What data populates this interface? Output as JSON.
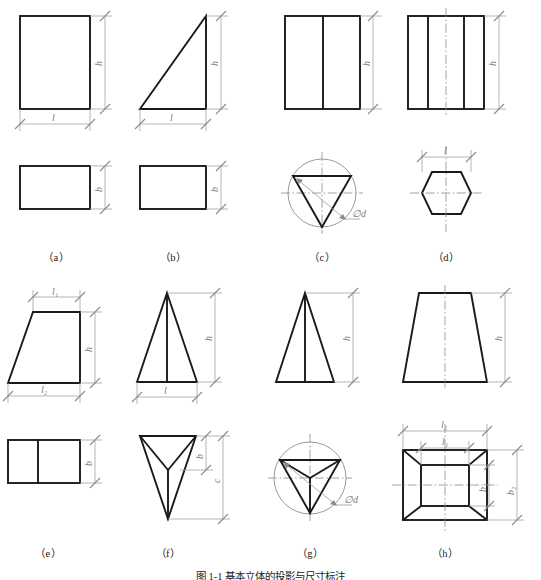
{
  "figure": {
    "caption_label": "图 1-1",
    "caption_text": "基本立体的投影与尺寸标注",
    "caption_full": "图 1-1    基本立体的投影与尺寸标注"
  },
  "style": {
    "object_line_color": "#1a1a1a",
    "dimension_line_color": "#9a9a9a",
    "center_line_color": "#8c8c8c",
    "background": "#ffffff",
    "label_color": "#222222"
  },
  "panels": [
    {
      "id": "a",
      "label": "（a）",
      "solid": "rectangular-prism",
      "front_view": "rectangle",
      "top_view": "rectangle",
      "dimensions": [
        {
          "name": "h",
          "label": "h",
          "view": "front",
          "orientation": "vertical"
        },
        {
          "name": "l",
          "label": "l",
          "view": "front",
          "orientation": "horizontal"
        },
        {
          "name": "b",
          "label": "b",
          "view": "top",
          "orientation": "vertical"
        }
      ]
    },
    {
      "id": "b",
      "label": "（b）",
      "solid": "triangular-wedge",
      "front_view": "right-triangle",
      "top_view": "rectangle",
      "dimensions": [
        {
          "name": "h",
          "label": "h",
          "view": "front",
          "orientation": "vertical"
        },
        {
          "name": "l",
          "label": "l",
          "view": "front",
          "orientation": "horizontal"
        },
        {
          "name": "b",
          "label": "b",
          "view": "top",
          "orientation": "vertical"
        }
      ]
    },
    {
      "id": "c",
      "label": "（c）",
      "solid": "triangular-prism",
      "front_view": "rectangle-with-vertical-edge",
      "top_view": "inverted-triangle-in-circle",
      "dimensions": [
        {
          "name": "h",
          "label": "h",
          "view": "front",
          "orientation": "vertical"
        },
        {
          "name": "d",
          "label": "∅d",
          "view": "top",
          "orientation": "leader"
        }
      ]
    },
    {
      "id": "d",
      "label": "（d）",
      "solid": "hexagonal-prism",
      "front_view": "rectangle-with-two-vertical-edges",
      "top_view": "hexagon",
      "dimensions": [
        {
          "name": "h",
          "label": "h",
          "view": "front",
          "orientation": "vertical"
        },
        {
          "name": "l",
          "label": "l",
          "view": "top",
          "orientation": "horizontal"
        }
      ]
    },
    {
      "id": "e",
      "label": "（e）",
      "solid": "trapezoidal-prism",
      "front_view": "trapezoid",
      "top_view": "rectangle-divided",
      "dimensions": [
        {
          "name": "l1",
          "label": "l₁",
          "view": "front",
          "orientation": "horizontal"
        },
        {
          "name": "h",
          "label": "h",
          "view": "front",
          "orientation": "vertical"
        },
        {
          "name": "l2",
          "label": "l₂",
          "view": "front",
          "orientation": "horizontal"
        },
        {
          "name": "b",
          "label": "b",
          "view": "top",
          "orientation": "vertical"
        }
      ]
    },
    {
      "id": "f",
      "label": "（f）",
      "solid": "triangular-pyramid",
      "front_view": "triangle-with-center-edge",
      "top_view": "inverted-pyramid-projection",
      "dimensions": [
        {
          "name": "h",
          "label": "h",
          "view": "front",
          "orientation": "vertical"
        },
        {
          "name": "l",
          "label": "l",
          "view": "front",
          "orientation": "horizontal"
        },
        {
          "name": "b",
          "label": "b",
          "view": "top",
          "orientation": "vertical"
        },
        {
          "name": "c",
          "label": "c",
          "view": "top",
          "orientation": "vertical"
        }
      ]
    },
    {
      "id": "g",
      "label": "（g）",
      "solid": "triangular-pyramid-circumscribed",
      "front_view": "triangle-with-center-edge",
      "top_view": "triangle-in-circle-with-apex-lines",
      "dimensions": [
        {
          "name": "h",
          "label": "h",
          "view": "front",
          "orientation": "vertical"
        },
        {
          "name": "d",
          "label": "∅d",
          "view": "top",
          "orientation": "leader"
        }
      ]
    },
    {
      "id": "h",
      "label": "（h）",
      "solid": "rectangular-frustum",
      "front_view": "trapezoid",
      "top_view": "nested-rectangles-with-diagonals",
      "dimensions": [
        {
          "name": "h",
          "label": "h",
          "view": "front",
          "orientation": "vertical"
        },
        {
          "name": "l2",
          "label": "l₂",
          "view": "top",
          "orientation": "horizontal"
        },
        {
          "name": "l1",
          "label": "l₁",
          "view": "top",
          "orientation": "horizontal"
        },
        {
          "name": "b1",
          "label": "b₁",
          "view": "top",
          "orientation": "vertical"
        },
        {
          "name": "b2",
          "label": "b₂",
          "view": "top",
          "orientation": "vertical"
        }
      ]
    }
  ],
  "labels": {
    "h": "h",
    "l": "l",
    "b": "b",
    "c": "c",
    "l1": "l₁",
    "l2": "l₂",
    "b1": "b₁",
    "b2": "b₂",
    "diameter": "∅d"
  }
}
